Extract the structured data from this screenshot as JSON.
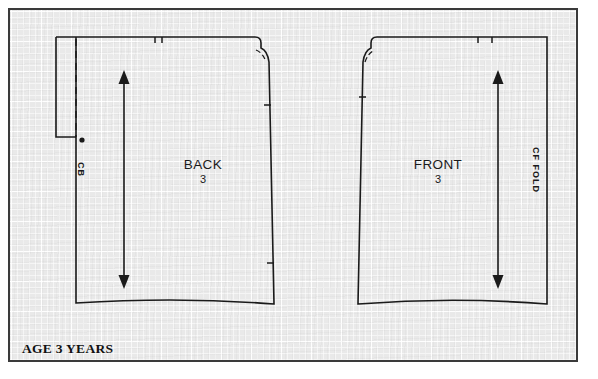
{
  "document": {
    "type": "sewing-pattern-layout",
    "age_label": "AGE 3 YEARS"
  },
  "canvas": {
    "width": 598,
    "height": 379,
    "paper_color": "#e9e9e9",
    "grid_line_color": "#ffffff",
    "ink_color": "#1a1a1a",
    "frame_color": "#3a3a3a",
    "grid_minor_px": 6,
    "grid_major_px": 30
  },
  "pieces": [
    {
      "id": "back",
      "name": "BACK",
      "size": "3",
      "name_x": 193,
      "name_y": 155,
      "size_x": 193,
      "size_y": 170,
      "edge_label": "CB",
      "edge_label_x": 78,
      "edge_label_y": 163,
      "grainline": {
        "x": 122,
        "top": 76,
        "bottom": 279
      },
      "notches_top": 2,
      "has_fold_dot": true
    },
    {
      "id": "front",
      "name": "FRONT",
      "size": "3",
      "name_x": 430,
      "name_y": 155,
      "size_x": 430,
      "size_y": 170,
      "edge_label": "CF FOLD",
      "edge_label_x": 533,
      "edge_label_y": 148,
      "grainline": {
        "x": 496,
        "top": 76,
        "bottom": 279
      },
      "notches_top": 2,
      "has_fold_dot": false
    }
  ],
  "markings": {
    "grainline_arrow": "double-headed-arrow",
    "center_back_line": "dashed",
    "fold_symbol": "dot",
    "notch": "tick-mark"
  }
}
